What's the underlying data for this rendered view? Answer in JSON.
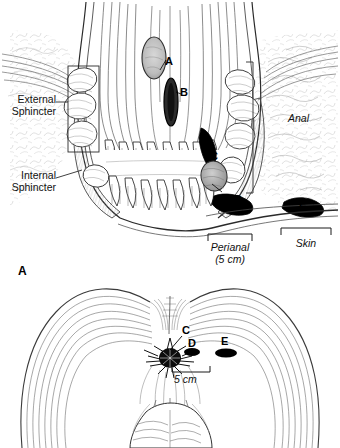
{
  "figure": {
    "panels": [
      {
        "id": "top",
        "name": "coronal-section",
        "description": "Coronal section of anal canal showing abscess locations A-E"
      },
      {
        "id": "bottom",
        "name": "perineal-view",
        "panel_label": "A",
        "description": "Perineal surface view showing anus and abscess sites C, D, E"
      }
    ],
    "annotations": {
      "external_sphincter": "External\nSphincter",
      "external_sphincter_line1": "External",
      "external_sphincter_line2": "Sphincter",
      "internal_sphincter_line1": "Internal",
      "internal_sphincter_line2": "Sphincter",
      "anal": "Anal",
      "perianal_line1": "Perianal",
      "perianal_line2": "(5 cm)",
      "skin": "Skin",
      "scale": "5 cm"
    },
    "markers": {
      "a": "A",
      "b": "B",
      "c": "C",
      "d": "D",
      "e": "E",
      "panel_a": "A"
    },
    "colors": {
      "ink": "#1a1a1a",
      "abscess_fill": "#000000",
      "hatch": "#555555",
      "light_hatch": "#8d8d8d",
      "background": "#ffffff"
    }
  }
}
